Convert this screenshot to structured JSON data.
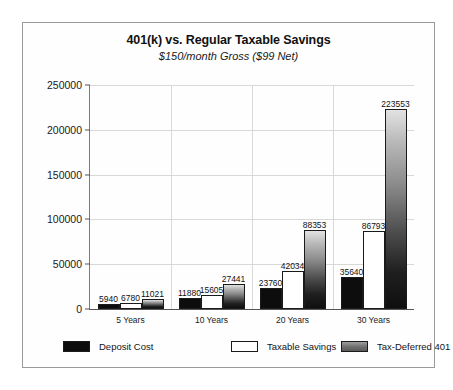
{
  "chart_data": {
    "type": "bar",
    "title": "401(k) vs. Regular Taxable Savings",
    "subtitle": "$150/month Gross ($99 Net)",
    "xlabel": "",
    "ylabel": "",
    "ylim": [
      0,
      250000
    ],
    "yticks": [
      0,
      50000,
      100000,
      150000,
      200000,
      250000
    ],
    "ytick_labels": [
      "0",
      "50000",
      "100000",
      "150000",
      "200000",
      "250000"
    ],
    "grid": true,
    "legend_position": "bottom",
    "categories": [
      "5 Years",
      "10 Years",
      "20 Years",
      "30 Years"
    ],
    "series": [
      {
        "name": "Deposit Cost",
        "color": "#0d0d0d",
        "values": [
          5940,
          11880,
          23760,
          35640
        ],
        "labels": [
          "5940",
          "11880",
          "23760",
          "35640"
        ]
      },
      {
        "name": "Taxable Savings",
        "color": "#ffffff",
        "values": [
          6780,
          15605,
          42034,
          86793
        ],
        "labels": [
          "6780",
          "15605",
          "42034",
          "86793"
        ]
      },
      {
        "name": "Tax-Deferred 401",
        "color": "#6e6e6e",
        "values": [
          11021,
          27441,
          88353,
          223553
        ],
        "labels": [
          "11021",
          "27441",
          "88353",
          "223553"
        ]
      }
    ]
  },
  "legend": {
    "items": [
      {
        "label": "Deposit Cost"
      },
      {
        "label": "Taxable Savings"
      },
      {
        "label": "Tax-Deferred 401"
      }
    ]
  }
}
